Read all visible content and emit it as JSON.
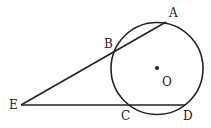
{
  "diagram": {
    "type": "geometry",
    "stroke_color": "#222222",
    "background": "#ffffff",
    "circle": {
      "name": "O",
      "cx": 157,
      "cy": 68.5,
      "r": 46
    },
    "points": [
      {
        "id": "A",
        "label": "A",
        "x": 166,
        "y": 22,
        "lx": 169,
        "ly": 17
      },
      {
        "id": "B",
        "label": "B",
        "x": 116,
        "y": 51,
        "lx": 104,
        "ly": 48
      },
      {
        "id": "C",
        "label": "C",
        "x": 129,
        "y": 105,
        "lx": 121,
        "ly": 120
      },
      {
        "id": "D",
        "label": "D",
        "x": 185,
        "y": 105,
        "lx": 183,
        "ly": 120
      },
      {
        "id": "E",
        "label": "E",
        "x": 21,
        "y": 105,
        "lx": 9,
        "ly": 109
      },
      {
        "id": "O",
        "label": "O",
        "x": 157,
        "y": 68,
        "lx": 162,
        "ly": 86
      }
    ],
    "segments": [
      {
        "from": "E",
        "to": "A"
      },
      {
        "from": "E",
        "to": "D"
      }
    ]
  }
}
